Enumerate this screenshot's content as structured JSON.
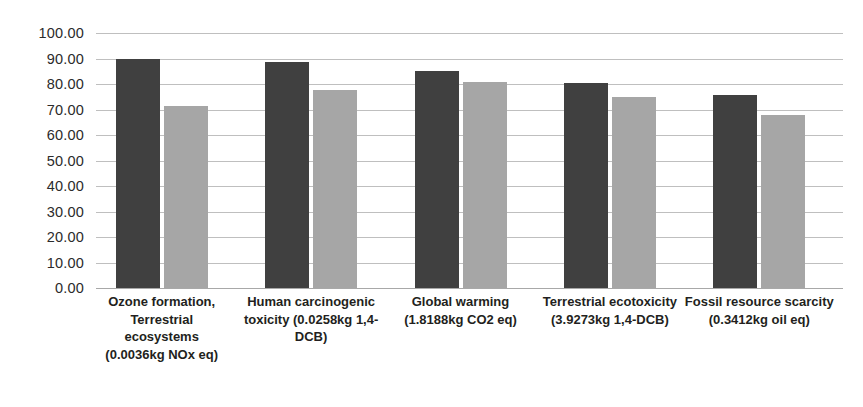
{
  "chart_data": {
    "type": "bar",
    "title": "",
    "subtitle": "",
    "xlabel": "",
    "ylabel": "",
    "ylim": [
      0,
      100
    ],
    "ytick_step": 10,
    "ytick_labels": [
      "100.00",
      "90.00",
      "80.00",
      "70.00",
      "60.00",
      "50.00",
      "40.00",
      "30.00",
      "20.00",
      "10.00",
      "0.00"
    ],
    "ytick_values": [
      100,
      90,
      80,
      70,
      60,
      50,
      40,
      30,
      20,
      10,
      0
    ],
    "grid": true,
    "legend": "none",
    "categories": [
      "Ozone formation, Terrestrial ecosystems (0.0036kg NOx eq)",
      "Human carcinogenic toxicity (0.0258kg 1,4-DCB)",
      "Global warming (1.8188kg CO2 eq)",
      "Terrestrial ecotoxicity (3.9273kg 1,4-DCB)",
      "Fossil resource scarcity (0.3412kg oil eq)"
    ],
    "series": [
      {
        "name": "Series 1",
        "color": "#404040",
        "values": [
          90.0,
          88.5,
          85.0,
          80.5,
          75.8
        ]
      },
      {
        "name": "Series 2",
        "color": "#a6a6a6",
        "values": [
          71.5,
          77.8,
          80.8,
          74.8,
          68.0
        ]
      }
    ],
    "colors": {
      "series1": "#404040",
      "series2": "#a6a6a6",
      "gridline": "#bfbfbf",
      "axis": "#a8a8a8",
      "tick_text": "#2b2b2b",
      "category_text": "#231f20",
      "background": "#ffffff"
    }
  }
}
